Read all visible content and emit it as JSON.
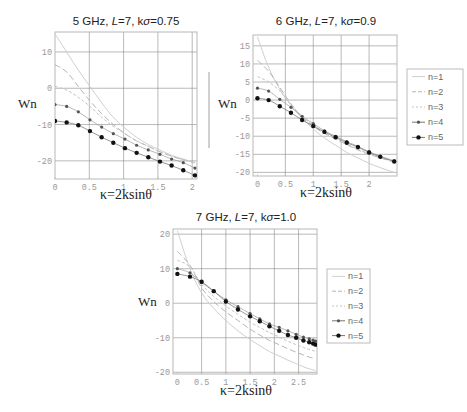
{
  "chart_data": [
    {
      "type": "line",
      "title": "5 GHz, L=7, kσ=0.75",
      "title_parts": {
        "pre": "5 GHz, ",
        "L": "L",
        "mid": "=7, k",
        "sigma": "σ",
        "post": "=0.75"
      },
      "xlabel": "κ=2ksinθ",
      "ylabel": "Wn",
      "xlim": [
        0,
        2.07
      ],
      "ylim": [
        -25,
        15.5
      ],
      "xticks": [
        0,
        0.5,
        1,
        1.5,
        2
      ],
      "xtick_labels": [
        "0",
        "0.5",
        "1",
        "1.5",
        "2"
      ],
      "yticks": [
        -20,
        -10,
        0,
        10
      ],
      "ytick_labels": [
        "-20",
        "-10",
        "0",
        "10"
      ],
      "grid": true,
      "legend": false,
      "frame": {
        "x": 55,
        "y": 32,
        "w": 142,
        "h": 147
      },
      "x": [
        0,
        0.17,
        0.34,
        0.51,
        0.68,
        0.85,
        1.02,
        1.19,
        1.36,
        1.53,
        1.7,
        1.87,
        2.04
      ],
      "series": [
        {
          "name": "n=1",
          "style": "solid",
          "values": [
            15,
            10,
            5,
            0.5,
            -4,
            -8,
            -11,
            -13.5,
            -15.5,
            -17,
            -18.5,
            -19.5,
            -20.5
          ]
        },
        {
          "name": "n=2",
          "style": "dash",
          "values": [
            6.5,
            4.5,
            0.5,
            -3.5,
            -7,
            -10,
            -12.5,
            -14.5,
            -16,
            -17.5,
            -18.7,
            -19.7,
            -20.5
          ]
        },
        {
          "name": "n=3",
          "style": "dashdot",
          "values": [
            0.5,
            -0.5,
            -2.5,
            -5,
            -8,
            -10.5,
            -12.5,
            -14.5,
            -16,
            -17.5,
            -18.7,
            -19.7,
            -20.5
          ]
        },
        {
          "name": "n=4",
          "style": "markers-small",
          "values": [
            -4.5,
            -5,
            -6.5,
            -8.7,
            -10.7,
            -12.5,
            -14,
            -15.7,
            -17,
            -18.2,
            -19.5,
            -20.5,
            -22
          ]
        },
        {
          "name": "n=5",
          "style": "markers-large",
          "values": [
            -9,
            -9.4,
            -10.2,
            -11.8,
            -13.5,
            -15,
            -16.5,
            -17.8,
            -19,
            -20.2,
            -21.3,
            -22.6,
            -24
          ]
        }
      ]
    },
    {
      "type": "line",
      "title": "6 GHz, L=7, kσ=0.9",
      "title_parts": {
        "pre": "6 GHz, ",
        "L": "L",
        "mid": "=7, k",
        "sigma": "σ",
        "post": "=0.9"
      },
      "xlabel": "κ=2ksinθ",
      "ylabel": "Wn",
      "xlim": [
        -0.08,
        2.5
      ],
      "ylim": [
        -21,
        18
      ],
      "xticks": [
        0,
        0.5,
        1,
        1.5,
        2
      ],
      "xtick_labels": [
        "0",
        "0.5",
        "1",
        "1.5",
        "2"
      ],
      "yticks": [
        -20,
        -15,
        -10,
        -5,
        0,
        5,
        10,
        15
      ],
      "ytick_labels": [
        "-20",
        "-15",
        "-10",
        "-5",
        "0",
        "5",
        "10",
        "15"
      ],
      "grid": true,
      "legend": true,
      "frame": {
        "x": 253,
        "y": 35,
        "w": 144,
        "h": 141
      },
      "x": [
        0,
        0.2,
        0.4,
        0.6,
        0.8,
        1.0,
        1.2,
        1.4,
        1.6,
        1.8,
        2.0,
        2.2,
        2.45
      ],
      "series": [
        {
          "name": "n=1",
          "style": "solid",
          "values": [
            17.5,
            9,
            3,
            -1.5,
            -5,
            -8,
            -10.5,
            -12.5,
            -14.5,
            -16,
            -17.5,
            -18.7,
            -20
          ]
        },
        {
          "name": "n=2",
          "style": "dash",
          "values": [
            11,
            8,
            3.5,
            -1,
            -4.8,
            -7.3,
            -9.2,
            -10.8,
            -12.3,
            -13.8,
            -15,
            -16,
            -17.2
          ]
        },
        {
          "name": "n=3",
          "style": "dashdot",
          "values": [
            6.5,
            5,
            2.5,
            -1.2,
            -4.5,
            -7,
            -9,
            -10.6,
            -12.1,
            -13.6,
            -14.8,
            -15.9,
            -17
          ]
        },
        {
          "name": "n=4",
          "style": "markers-small",
          "values": [
            3.3,
            2.5,
            0.2,
            -2,
            -4.5,
            -6.5,
            -8.5,
            -10,
            -11.5,
            -12.8,
            -14.3,
            -15.5,
            -16.8
          ]
        },
        {
          "name": "n=5",
          "style": "markers-large",
          "values": [
            0.5,
            0,
            -1.7,
            -3.5,
            -5.5,
            -7.2,
            -8.8,
            -10.3,
            -11.8,
            -13,
            -14.5,
            -15.7,
            -17
          ]
        }
      ],
      "legend_box": {
        "x": 407,
        "y": 69,
        "w": 56,
        "h": 76
      }
    },
    {
      "type": "line",
      "title": "7 GHz, L=7, kσ=1.0",
      "title_parts": {
        "pre": "7 GHz, ",
        "L": "L",
        "mid": "=7, k",
        "sigma": "σ",
        "post": "=1.0"
      },
      "xlabel": "κ=2ksinθ",
      "ylabel": "Wn",
      "xlim": [
        -0.09,
        2.88
      ],
      "ylim": [
        -20.5,
        21.5
      ],
      "xticks": [
        0,
        0.5,
        1,
        1.5,
        2,
        2.5
      ],
      "xtick_labels": [
        "0",
        "0.5",
        "1",
        "1.5",
        "2",
        "2.5"
      ],
      "yticks": [
        -20,
        -10,
        0,
        10,
        20
      ],
      "ytick_labels": [
        "-20",
        "-10",
        "0",
        "10",
        "20"
      ],
      "grid": true,
      "legend": true,
      "frame": {
        "x": 173,
        "y": 229,
        "w": 144,
        "h": 145
      },
      "x": [
        0,
        0.26,
        0.5,
        0.75,
        1.0,
        1.25,
        1.5,
        1.7,
        1.9,
        2.1,
        2.28,
        2.45,
        2.6,
        2.72,
        2.8,
        2.85
      ],
      "series": [
        {
          "name": "n=1",
          "style": "solid",
          "values": [
            21,
            10,
            3,
            -1.5,
            -5,
            -8,
            -10.5,
            -12.3,
            -14,
            -15.3,
            -16.5,
            -17.5,
            -18.4,
            -19,
            -19.3,
            -19.5
          ]
        },
        {
          "name": "n=2",
          "style": "dash",
          "values": [
            15,
            11,
            4.5,
            0.5,
            -2.5,
            -5,
            -7.5,
            -9.2,
            -10.8,
            -12,
            -13.2,
            -14.2,
            -15,
            -15.6,
            -15.9,
            -16
          ]
        },
        {
          "name": "n=3",
          "style": "dashdot",
          "values": [
            12.5,
            10.5,
            5.5,
            2,
            -0.8,
            -3.2,
            -5.5,
            -7,
            -8.5,
            -9.8,
            -11,
            -12,
            -12.8,
            -13.4,
            -13.7,
            -14
          ]
        },
        {
          "name": "n=4",
          "style": "markers-small",
          "values": [
            10,
            8.8,
            6,
            3.5,
            1,
            -1,
            -3,
            -4.5,
            -6,
            -7,
            -8,
            -9,
            -9.8,
            -10.3,
            -10.7,
            -11
          ]
        },
        {
          "name": "n=5",
          "style": "markers-large",
          "values": [
            8.5,
            7.7,
            6.2,
            3.5,
            0.5,
            -1.8,
            -3.8,
            -5.2,
            -6.7,
            -8,
            -9.2,
            -10,
            -10.8,
            -11.3,
            -11.7,
            -12
          ]
        }
      ],
      "legend_box": {
        "x": 327,
        "y": 269,
        "w": 43,
        "h": 74
      }
    }
  ],
  "legend_labels": [
    "n=1",
    "n=2",
    "n=3",
    "n=4",
    "n=5"
  ],
  "colors": {
    "frame": "#b8b8b8",
    "grid": "#8a8a8a",
    "n1": "#cfcfcf",
    "n2": "#b5b5b5",
    "n3": "#c4c4c4",
    "n4": "#555555",
    "n5": "#111111"
  }
}
